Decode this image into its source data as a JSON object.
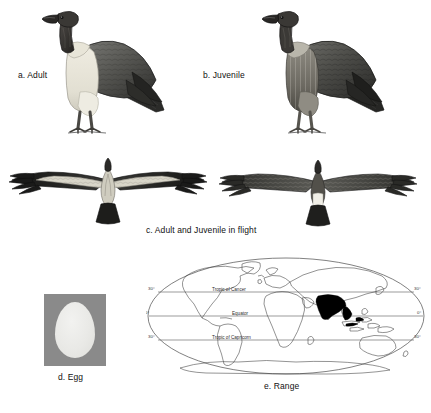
{
  "plate": {
    "subject": "White-rumped Vulture",
    "panels": [
      {
        "key": "adult",
        "label": "a. Adult"
      },
      {
        "key": "juvenile",
        "label": "b. Juvenile"
      },
      {
        "key": "flight",
        "label": "c. Adult and Juvenile in flight"
      },
      {
        "key": "egg",
        "label": "d. Egg"
      },
      {
        "key": "range",
        "label": "e. Range"
      }
    ]
  },
  "captions": {
    "adult": "a. Adult",
    "juvenile": "b. Juvenile",
    "flight": "c. Adult and Juvenile in flight",
    "egg": "d. Egg",
    "range": "e. Range"
  },
  "egg": {
    "background_color": "#8a8a8a",
    "shell_color": "#ececeA"
  },
  "map": {
    "projection": "oval world projection",
    "latitude_lines": [
      {
        "name": "Tropic of Cancer",
        "label": "Tropic of Cancer",
        "degrees": 23.5,
        "tick_left": "30°",
        "tick_right": "30°"
      },
      {
        "name": "Equator",
        "label": "Equator",
        "degrees": 0,
        "tick_left": "0°",
        "tick_right": "0°"
      },
      {
        "name": "Tropic of Capricorn",
        "label": "Tropic of Capricorn",
        "degrees": -23.5,
        "tick_left": "30°",
        "tick_right": "30°"
      }
    ],
    "tick_labels_left": [
      "30°",
      "0°",
      "30°"
    ],
    "tick_labels_right": [
      "30°",
      "0°",
      "30°"
    ],
    "range_shading_color": "#000000",
    "range_regions": [
      "Indian subcontinent",
      "Indochina",
      "Southeast Asia"
    ],
    "outline_color": "#444444"
  },
  "colors": {
    "ink": "#1a1a1a",
    "paper": "#ffffff",
    "plumage_dark": "#3c3c3c",
    "plumage_mid": "#6e6e6e",
    "plumage_pale": "#e3e1d8",
    "bare_skin": "#2e2e2e"
  }
}
